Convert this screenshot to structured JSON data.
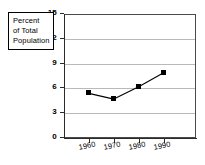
{
  "legend": {
    "lines": [
      "Percent",
      "of Total",
      "Population"
    ]
  },
  "chart_data": {
    "type": "line",
    "title": "",
    "subtitle": "",
    "xlabel": "",
    "ylabel": "Percent of Total Population",
    "categories": [
      "1960",
      "1970",
      "1980",
      "1990"
    ],
    "x": [
      1960,
      1970,
      1980,
      1990
    ],
    "values": [
      5.4,
      4.7,
      6.2,
      7.9
    ],
    "series": [
      {
        "name": "Percent of Total Population",
        "values": [
          5.4,
          4.7,
          6.2,
          7.9
        ]
      }
    ],
    "ylim": [
      0,
      15
    ],
    "yticks": [
      0,
      3,
      6,
      9,
      12,
      15
    ],
    "ytick_labels": [
      "0",
      "3",
      "6",
      "9",
      "12",
      "15"
    ],
    "xtick_labels": [
      "1960",
      "1970",
      "1980",
      "1990"
    ],
    "grid": "horizontal",
    "legend_position": "upper-left-boxed",
    "marker": "square",
    "line_color": "#000000",
    "marker_color": "#000000",
    "grid_color": "#b9b9b9",
    "axis_color": "#2b2b2b",
    "background": "#ffffff"
  }
}
